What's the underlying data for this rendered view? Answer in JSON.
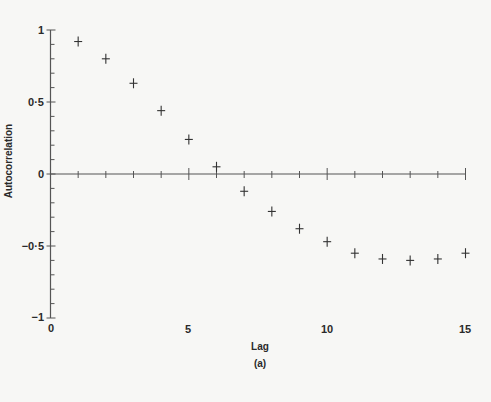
{
  "chart_data": {
    "type": "scatter",
    "title": "",
    "caption": "(a)",
    "xlabel": "Lag",
    "ylabel": "Autocorrelation",
    "xlim": [
      0,
      15
    ],
    "ylim": [
      -1,
      1
    ],
    "grid": false,
    "marker": "plus",
    "x_ticks": [
      0,
      5,
      10,
      15
    ],
    "x_tick_labels": [
      "0",
      "5",
      "10",
      "15"
    ],
    "y_ticks": [
      1,
      0.5,
      0,
      -0.5,
      -1
    ],
    "y_tick_labels": [
      "1",
      "0·5",
      "0",
      "−0·5",
      "−1"
    ],
    "x": [
      1,
      2,
      3,
      4,
      5,
      6,
      7,
      8,
      9,
      10,
      11,
      12,
      13,
      14,
      15
    ],
    "series": [
      {
        "name": "Autocorrelation",
        "values": [
          0.92,
          0.8,
          0.63,
          0.44,
          0.24,
          0.05,
          -0.12,
          -0.26,
          -0.38,
          -0.47,
          -0.55,
          -0.59,
          -0.6,
          -0.59,
          -0.55
        ]
      }
    ]
  },
  "labels": {
    "xlabel": "Lag",
    "ylabel": "Autocorrelation",
    "caption": "(a)",
    "x_tick_0": "0",
    "x_tick_5": "5",
    "x_tick_10": "10",
    "x_tick_15": "15",
    "y_tick_1": "1",
    "y_tick_05": "0·5",
    "y_tick_0": "0",
    "y_tick_m05": "−0·5",
    "y_tick_m1": "−1"
  }
}
